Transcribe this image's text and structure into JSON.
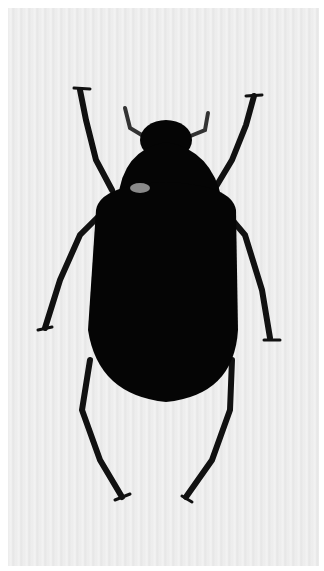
{
  "image": {
    "subject": "black beetle specimen, dorsal view",
    "background": "light gray striped",
    "colors": {
      "beetle": "#050505",
      "background": "#ececec",
      "border": "#ffffff",
      "highlight": "#8a8a8a"
    }
  }
}
